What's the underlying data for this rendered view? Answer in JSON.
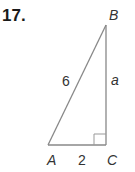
{
  "problem": {
    "number": "17.",
    "vertices": {
      "A": "A",
      "B": "B",
      "C": "C"
    },
    "sides": {
      "hypotenuse_AB": "6",
      "leg_AC": "2",
      "leg_BC": "a"
    },
    "right_angle_at": "C"
  },
  "colors": {
    "line": "#888888",
    "text": "#333333"
  }
}
